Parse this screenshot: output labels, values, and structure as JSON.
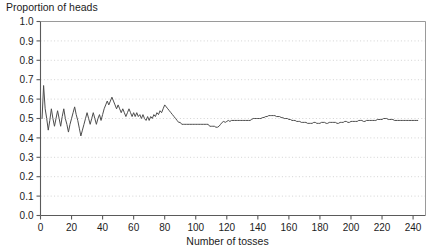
{
  "chart_data": {
    "type": "line",
    "title": "",
    "ylabel": "Proportion of heads",
    "xlabel": "Number of tosses",
    "xlim": [
      0,
      248
    ],
    "ylim": [
      0.0,
      1.0
    ],
    "grid": true,
    "grid_axis": "y",
    "legend": null,
    "line_color": "#4d4d4d",
    "xticks": [
      0,
      20,
      40,
      60,
      80,
      100,
      120,
      140,
      160,
      180,
      200,
      220,
      240
    ],
    "xticklabels": [
      "0",
      "20",
      "40",
      "60",
      "80",
      "100",
      "120",
      "140",
      "160",
      "180",
      "200",
      "220",
      "240"
    ],
    "yticks": [
      0.0,
      0.1,
      0.2,
      0.3,
      0.4,
      0.5,
      0.6,
      0.7,
      0.8,
      0.9,
      1.0
    ],
    "yticklabels": [
      "0.0",
      "0.1",
      "0.2",
      "0.3",
      "0.4",
      "0.5",
      "0.6",
      "0.7",
      "0.8",
      "0.9",
      "1.0"
    ],
    "x": [
      1,
      2,
      3,
      4,
      5,
      6,
      7,
      8,
      9,
      10,
      11,
      12,
      13,
      14,
      15,
      16,
      17,
      18,
      19,
      20,
      21,
      22,
      23,
      24,
      25,
      26,
      27,
      28,
      29,
      30,
      31,
      32,
      33,
      34,
      35,
      36,
      37,
      38,
      39,
      40,
      41,
      42,
      43,
      44,
      45,
      46,
      47,
      48,
      49,
      50,
      51,
      52,
      53,
      54,
      55,
      56,
      57,
      58,
      59,
      60,
      61,
      62,
      63,
      64,
      65,
      66,
      67,
      68,
      69,
      70,
      71,
      72,
      73,
      74,
      75,
      76,
      77,
      78,
      79,
      80,
      81,
      82,
      83,
      84,
      85,
      86,
      87,
      88,
      89,
      90,
      91,
      92,
      93,
      94,
      95,
      96,
      97,
      98,
      99,
      100,
      101,
      102,
      103,
      104,
      105,
      106,
      107,
      108,
      109,
      110,
      111,
      112,
      113,
      114,
      115,
      116,
      117,
      118,
      119,
      120,
      121,
      122,
      123,
      124,
      125,
      126,
      127,
      128,
      129,
      130,
      131,
      132,
      133,
      134,
      135,
      136,
      137,
      138,
      139,
      140,
      141,
      142,
      143,
      144,
      145,
      146,
      147,
      148,
      149,
      150,
      151,
      152,
      153,
      154,
      155,
      156,
      157,
      158,
      159,
      160,
      161,
      162,
      163,
      164,
      165,
      166,
      167,
      168,
      169,
      170,
      171,
      172,
      173,
      174,
      175,
      176,
      177,
      178,
      179,
      180,
      181,
      182,
      183,
      184,
      185,
      186,
      187,
      188,
      189,
      190,
      191,
      192,
      193,
      194,
      195,
      196,
      197,
      198,
      199,
      200,
      201,
      202,
      203,
      204,
      205,
      206,
      207,
      208,
      209,
      210,
      211,
      212,
      213,
      214,
      215,
      216,
      217,
      218,
      219,
      220,
      221,
      222,
      223,
      224,
      225,
      226,
      227,
      228,
      229,
      230,
      231,
      232,
      233,
      234,
      235,
      236,
      237,
      238,
      239,
      240,
      241,
      242,
      243,
      244,
      245,
      246,
      247
    ],
    "y": [
      0.5,
      0.67,
      0.55,
      0.5,
      0.44,
      0.49,
      0.55,
      0.5,
      0.46,
      0.5,
      0.54,
      0.5,
      0.46,
      0.51,
      0.55,
      0.5,
      0.47,
      0.43,
      0.47,
      0.5,
      0.53,
      0.56,
      0.52,
      0.49,
      0.45,
      0.41,
      0.44,
      0.47,
      0.5,
      0.53,
      0.5,
      0.47,
      0.5,
      0.53,
      0.5,
      0.47,
      0.5,
      0.52,
      0.49,
      0.52,
      0.55,
      0.57,
      0.59,
      0.57,
      0.59,
      0.61,
      0.59,
      0.57,
      0.55,
      0.57,
      0.55,
      0.53,
      0.55,
      0.53,
      0.51,
      0.53,
      0.55,
      0.53,
      0.51,
      0.53,
      0.51,
      0.53,
      0.51,
      0.52,
      0.5,
      0.52,
      0.5,
      0.49,
      0.51,
      0.49,
      0.51,
      0.5,
      0.52,
      0.51,
      0.53,
      0.52,
      0.54,
      0.53,
      0.55,
      0.57,
      0.56,
      0.55,
      0.54,
      0.53,
      0.52,
      0.51,
      0.5,
      0.49,
      0.48,
      0.48,
      0.47,
      0.47,
      0.47,
      0.47,
      0.47,
      0.47,
      0.47,
      0.47,
      0.47,
      0.47,
      0.47,
      0.47,
      0.47,
      0.47,
      0.47,
      0.47,
      0.47,
      0.47,
      0.46,
      0.46,
      0.46,
      0.46,
      0.455,
      0.455,
      0.46,
      0.47,
      0.48,
      0.485,
      0.48,
      0.485,
      0.49,
      0.485,
      0.49,
      0.49,
      0.49,
      0.49,
      0.49,
      0.49,
      0.49,
      0.49,
      0.49,
      0.49,
      0.49,
      0.49,
      0.49,
      0.495,
      0.5,
      0.5,
      0.5,
      0.5,
      0.5,
      0.5,
      0.505,
      0.505,
      0.51,
      0.51,
      0.515,
      0.515,
      0.515,
      0.515,
      0.515,
      0.51,
      0.51,
      0.51,
      0.505,
      0.505,
      0.5,
      0.5,
      0.5,
      0.495,
      0.495,
      0.49,
      0.49,
      0.49,
      0.485,
      0.485,
      0.485,
      0.48,
      0.48,
      0.48,
      0.48,
      0.475,
      0.475,
      0.475,
      0.475,
      0.48,
      0.48,
      0.475,
      0.475,
      0.475,
      0.48,
      0.48,
      0.48,
      0.475,
      0.475,
      0.48,
      0.48,
      0.48,
      0.48,
      0.48,
      0.475,
      0.475,
      0.48,
      0.48,
      0.48,
      0.485,
      0.485,
      0.48,
      0.48,
      0.485,
      0.485,
      0.485,
      0.485,
      0.485,
      0.49,
      0.49,
      0.49,
      0.485,
      0.485,
      0.49,
      0.49,
      0.49,
      0.49,
      0.49,
      0.49,
      0.49,
      0.495,
      0.495,
      0.495,
      0.495,
      0.5,
      0.5,
      0.5,
      0.495,
      0.495,
      0.495,
      0.495,
      0.49,
      0.49,
      0.49,
      0.49,
      0.49,
      0.49,
      0.49,
      0.49,
      0.49,
      0.49,
      0.49,
      0.49,
      0.49,
      0.49,
      0.49,
      0.49
    ]
  }
}
